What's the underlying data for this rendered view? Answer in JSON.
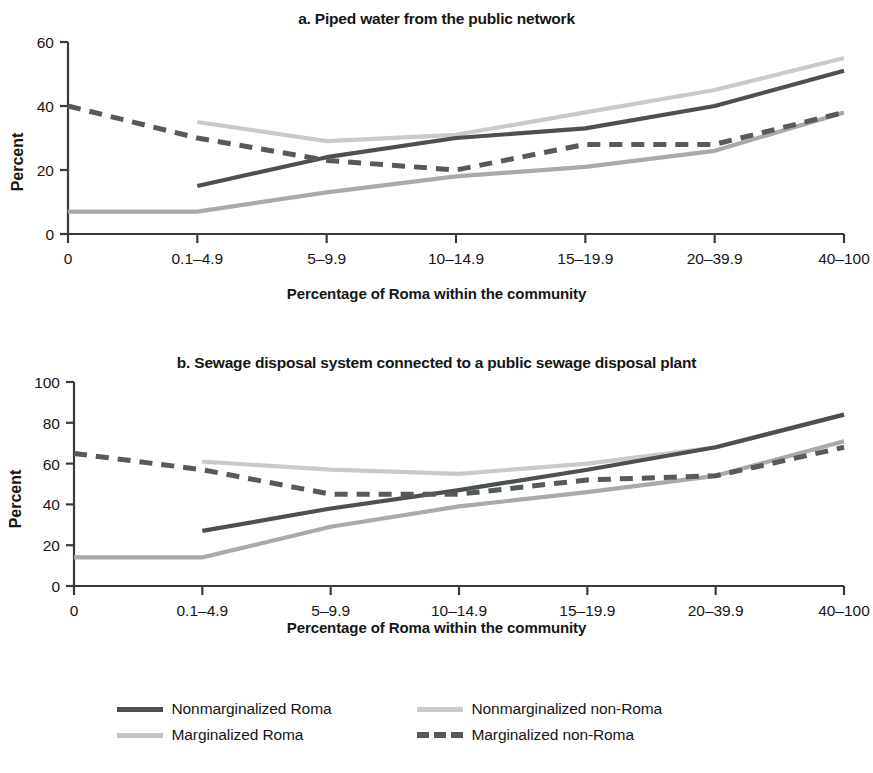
{
  "axis_label_x": "Percentage of Roma within the community",
  "axis_label_y": "Percent",
  "categories": [
    "0",
    "0.1–4.9",
    "5–9.9",
    "10–14.9",
    "15–19.9",
    "20–39.9",
    "40–100"
  ],
  "panel_a": {
    "title": "a. Piped water from the public network",
    "y_ticks": [
      "0",
      "20",
      "40",
      "60"
    ]
  },
  "panel_b": {
    "title": "b. Sewage disposal system connected to a public sewage disposal plant",
    "y_ticks": [
      "0",
      "20",
      "40",
      "60",
      "80",
      "100"
    ]
  },
  "legend": {
    "items": [
      {
        "label": "Nonmarginalized Roma",
        "style": "solid",
        "color": "#4b5153"
      },
      {
        "label": "Nonmarginalized non-Roma",
        "style": "solid",
        "color": "#c9cbc9"
      },
      {
        "label": "Marginalized Roma",
        "style": "solid",
        "color": "#a8abaa"
      },
      {
        "label": "Marginalized non-Roma",
        "style": "dashed",
        "color": "#555a5c"
      }
    ]
  },
  "colors": {
    "nonmarg_roma": "#4b5153",
    "nonmarg_nonroma": "#c9cbc9",
    "marg_roma": "#a8abaa",
    "marg_nonroma": "#555a5c",
    "axis": "#3a3a3a"
  },
  "chart_data": [
    {
      "type": "line",
      "title": "a. Piped water from the public network",
      "xlabel": "Percentage of Roma within the community",
      "ylabel": "Percent",
      "categories": [
        "0",
        "0.1–4.9",
        "5–9.9",
        "10–14.9",
        "15–19.9",
        "20–39.9",
        "40–100"
      ],
      "ylim": [
        0,
        60
      ],
      "yticks": [
        0,
        20,
        40,
        60
      ],
      "grid": false,
      "legend_position": "bottom",
      "series": [
        {
          "name": "Nonmarginalized Roma",
          "style": "solid",
          "color": "#4b5153",
          "values": [
            null,
            15,
            24,
            30,
            33,
            40,
            51
          ]
        },
        {
          "name": "Nonmarginalized non-Roma",
          "style": "solid",
          "color": "#c9cbc9",
          "values": [
            null,
            35,
            29,
            31,
            38,
            45,
            55
          ]
        },
        {
          "name": "Marginalized Roma",
          "style": "solid",
          "color": "#a8abaa",
          "values": [
            7,
            7,
            13,
            18,
            21,
            26,
            38
          ]
        },
        {
          "name": "Marginalized non-Roma",
          "style": "dashed",
          "color": "#555a5c",
          "values": [
            40,
            30,
            23,
            20,
            28,
            28,
            38
          ]
        }
      ]
    },
    {
      "type": "line",
      "title": "b. Sewage disposal system connected to a public sewage disposal plant",
      "xlabel": "Percentage of Roma within the community",
      "ylabel": "Percent",
      "categories": [
        "0",
        "0.1–4.9",
        "5–9.9",
        "10–14.9",
        "15–19.9",
        "20–39.9",
        "40–100"
      ],
      "ylim": [
        0,
        100
      ],
      "yticks": [
        0,
        20,
        40,
        60,
        80,
        100
      ],
      "grid": false,
      "legend_position": "bottom",
      "series": [
        {
          "name": "Nonmarginalized Roma",
          "style": "solid",
          "color": "#4b5153",
          "values": [
            null,
            27,
            38,
            47,
            57,
            68,
            84
          ]
        },
        {
          "name": "Nonmarginalized non-Roma",
          "style": "solid",
          "color": "#c9cbc9",
          "values": [
            null,
            61,
            57,
            55,
            60,
            68,
            84
          ]
        },
        {
          "name": "Marginalized Roma",
          "style": "solid",
          "color": "#a8abaa",
          "values": [
            14,
            14,
            29,
            39,
            46,
            54,
            71
          ]
        },
        {
          "name": "Marginalized non-Roma",
          "style": "dashed",
          "color": "#555a5c",
          "values": [
            65,
            57,
            45,
            45,
            52,
            54,
            68
          ]
        }
      ]
    }
  ]
}
